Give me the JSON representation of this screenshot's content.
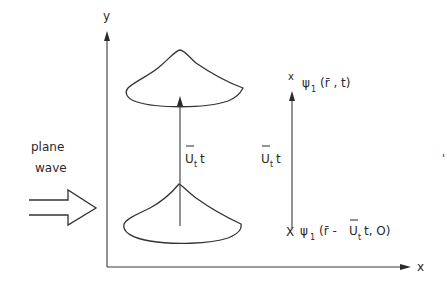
{
  "figure": {
    "axes": {
      "y_label": "y",
      "x_label": "x"
    },
    "incident": {
      "line1": "plane",
      "line2": "wave",
      "arrow_icon": "double-outline-arrow-right"
    },
    "displacement": {
      "center_label_U": "U",
      "center_label_sub": "t",
      "center_label_t": "t",
      "right_label_U": "U",
      "right_label_sub": "t",
      "right_label_t": "t"
    },
    "right_scale": {
      "top_marker": "x",
      "bottom_marker": "X"
    },
    "wavefunctions": {
      "top": {
        "psi": "ψ",
        "sub": "1",
        "args": "(r̄ , t)"
      },
      "bottom": {
        "psi": "ψ",
        "sub": "1",
        "args_pre": "(r̄ - ",
        "U": "U",
        "U_sub": "t",
        "args_post": "t, O)"
      }
    },
    "stray_mark": "'",
    "colors": {
      "ink": "#333333",
      "background": "#ffffff"
    }
  }
}
